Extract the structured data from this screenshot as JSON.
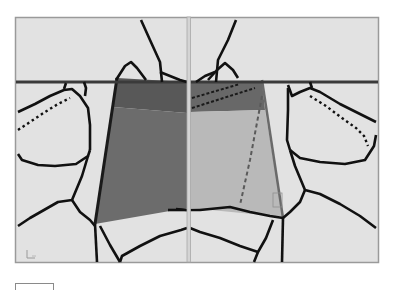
{
  "viewport": {
    "label": "3D mesh viewport (split view)",
    "background_color": "#e2e2e2",
    "frame_color": "#9a9a9a",
    "divider_color": "#b0b0b0",
    "wire_color": "#111111",
    "ground_line_color": "#3a3a3a",
    "panes": [
      {
        "name": "left-pane",
        "face_top_color": "#5c5c5c",
        "face_main_color": "#6e6e6e"
      },
      {
        "name": "right-pane",
        "face_top_color": "#6a6a6a",
        "face_main_color": "#b8b8b8"
      }
    ],
    "axis_glyph": "L"
  },
  "status_bar": {
    "box_label": ""
  }
}
